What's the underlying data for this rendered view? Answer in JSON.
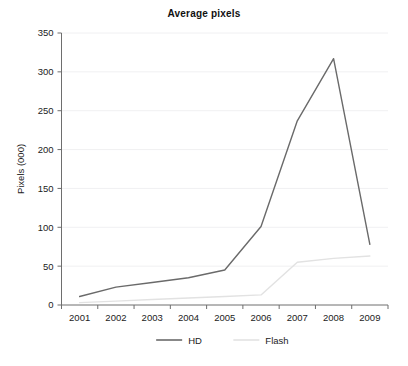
{
  "chart_data": {
    "type": "line",
    "title": "Average pixels",
    "xlabel": "",
    "ylabel": "Pixels (000)",
    "categories": [
      "2001",
      "2002",
      "2003",
      "2004",
      "2005",
      "2006",
      "2007",
      "2008",
      "2009"
    ],
    "x_tick_labels": [
      "2001",
      "2002",
      "2003",
      "2004",
      "2005",
      "2006",
      "2007",
      "2008",
      "2009"
    ],
    "y_tick_labels": [
      "0",
      "50",
      "100",
      "150",
      "200",
      "250",
      "300",
      "350"
    ],
    "y_tick_values": [
      0,
      50,
      100,
      150,
      200,
      250,
      300,
      350
    ],
    "ylim": [
      0,
      350
    ],
    "grid": true,
    "legend_position": "bottom",
    "series": [
      {
        "name": "HD",
        "color": "#6a6a6a",
        "values": [
          11,
          23,
          29,
          35,
          45,
          101,
          237,
          317,
          78
        ]
      },
      {
        "name": "Flash",
        "color": "#e2e2e2",
        "values": [
          3,
          5,
          7,
          9,
          11,
          13,
          55,
          60,
          63
        ]
      }
    ]
  },
  "legend": {
    "items": [
      {
        "label": "HD",
        "color": "#6a6a6a"
      },
      {
        "label": "Flash",
        "color": "#e2e2e2"
      }
    ]
  }
}
